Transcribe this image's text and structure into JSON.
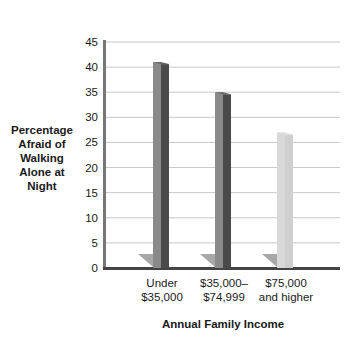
{
  "chart_data": {
    "type": "bar",
    "title": "",
    "xlabel": "Annual Family Income",
    "ylabel": "Percentage\nAfraid of\nWalking\nAlone at\nNight",
    "categories": [
      "Under\n$35,000",
      "$35,000–\n$74,999",
      "$75,000\nand higher"
    ],
    "values": [
      41,
      35,
      27
    ],
    "ylim": [
      0,
      45
    ],
    "yticks": [
      0,
      5,
      10,
      15,
      20,
      25,
      30,
      35,
      40,
      45
    ],
    "grid": true,
    "style": "3d",
    "bar_colors": [
      "#4a4a4a",
      "#4a4a4a",
      "#c8c8c8"
    ]
  }
}
